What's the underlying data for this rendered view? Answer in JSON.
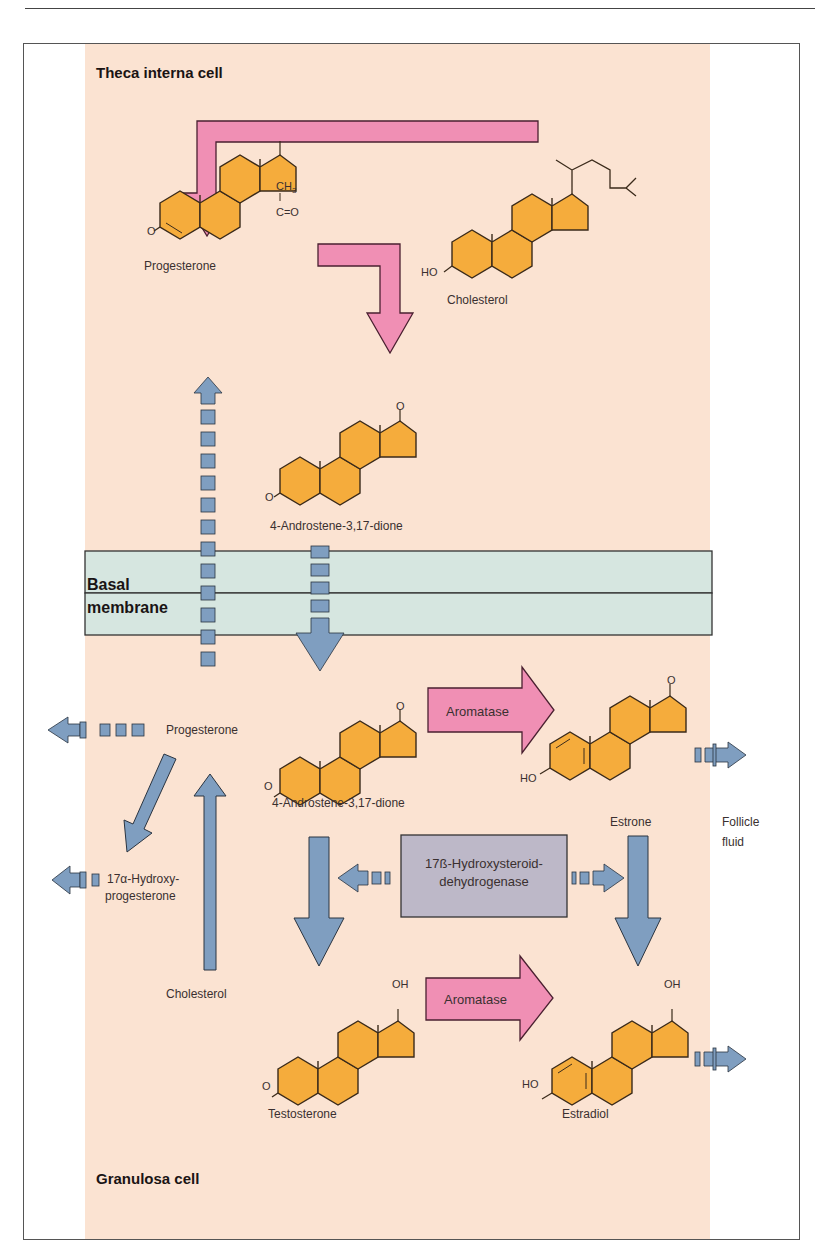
{
  "regions": {
    "theca": "Theca interna cell",
    "granulosa": "Granulosa cell",
    "membrane_line1": "Basal",
    "membrane_line2": "membrane",
    "follicle_line1": "Follicle",
    "follicle_line2": "fluid"
  },
  "molecules": {
    "progesterone_top": "Progesterone",
    "cholesterol_top": "Cholesterol",
    "androstenedione_top": "4-Androstene-3,17-dione",
    "progesterone_gran": "Progesterone",
    "hydroxyprog_line1": "17α-Hydroxy-",
    "hydroxyprog_line2": "progesterone",
    "cholesterol_gran": "Cholesterol",
    "androstenedione_gran": "4-Androstene-3,17-dione",
    "estrone": "Estrone",
    "testosterone": "Testosterone",
    "estradiol": "Estradiol"
  },
  "groups": {
    "ch3": "CH",
    "ch3_sub": "3",
    "co": "C=O",
    "o": "O",
    "oh": "OH",
    "ho": "HO"
  },
  "enzymes": {
    "aromatase_1": "Aromatase",
    "aromatase_2": "Aromatase",
    "hsd_line1": "17ß-Hydroxysteroid-",
    "hsd_line2": "dehydrogenase"
  },
  "colors": {
    "cell_bg": "#fbe3d2",
    "pink_arrow": "#f08fb4",
    "blue_arrow": "#7f9ec0",
    "membrane": "#d6e6e0",
    "ring": "#f5ac3c",
    "enzyme_box": "#bdb8c8"
  }
}
